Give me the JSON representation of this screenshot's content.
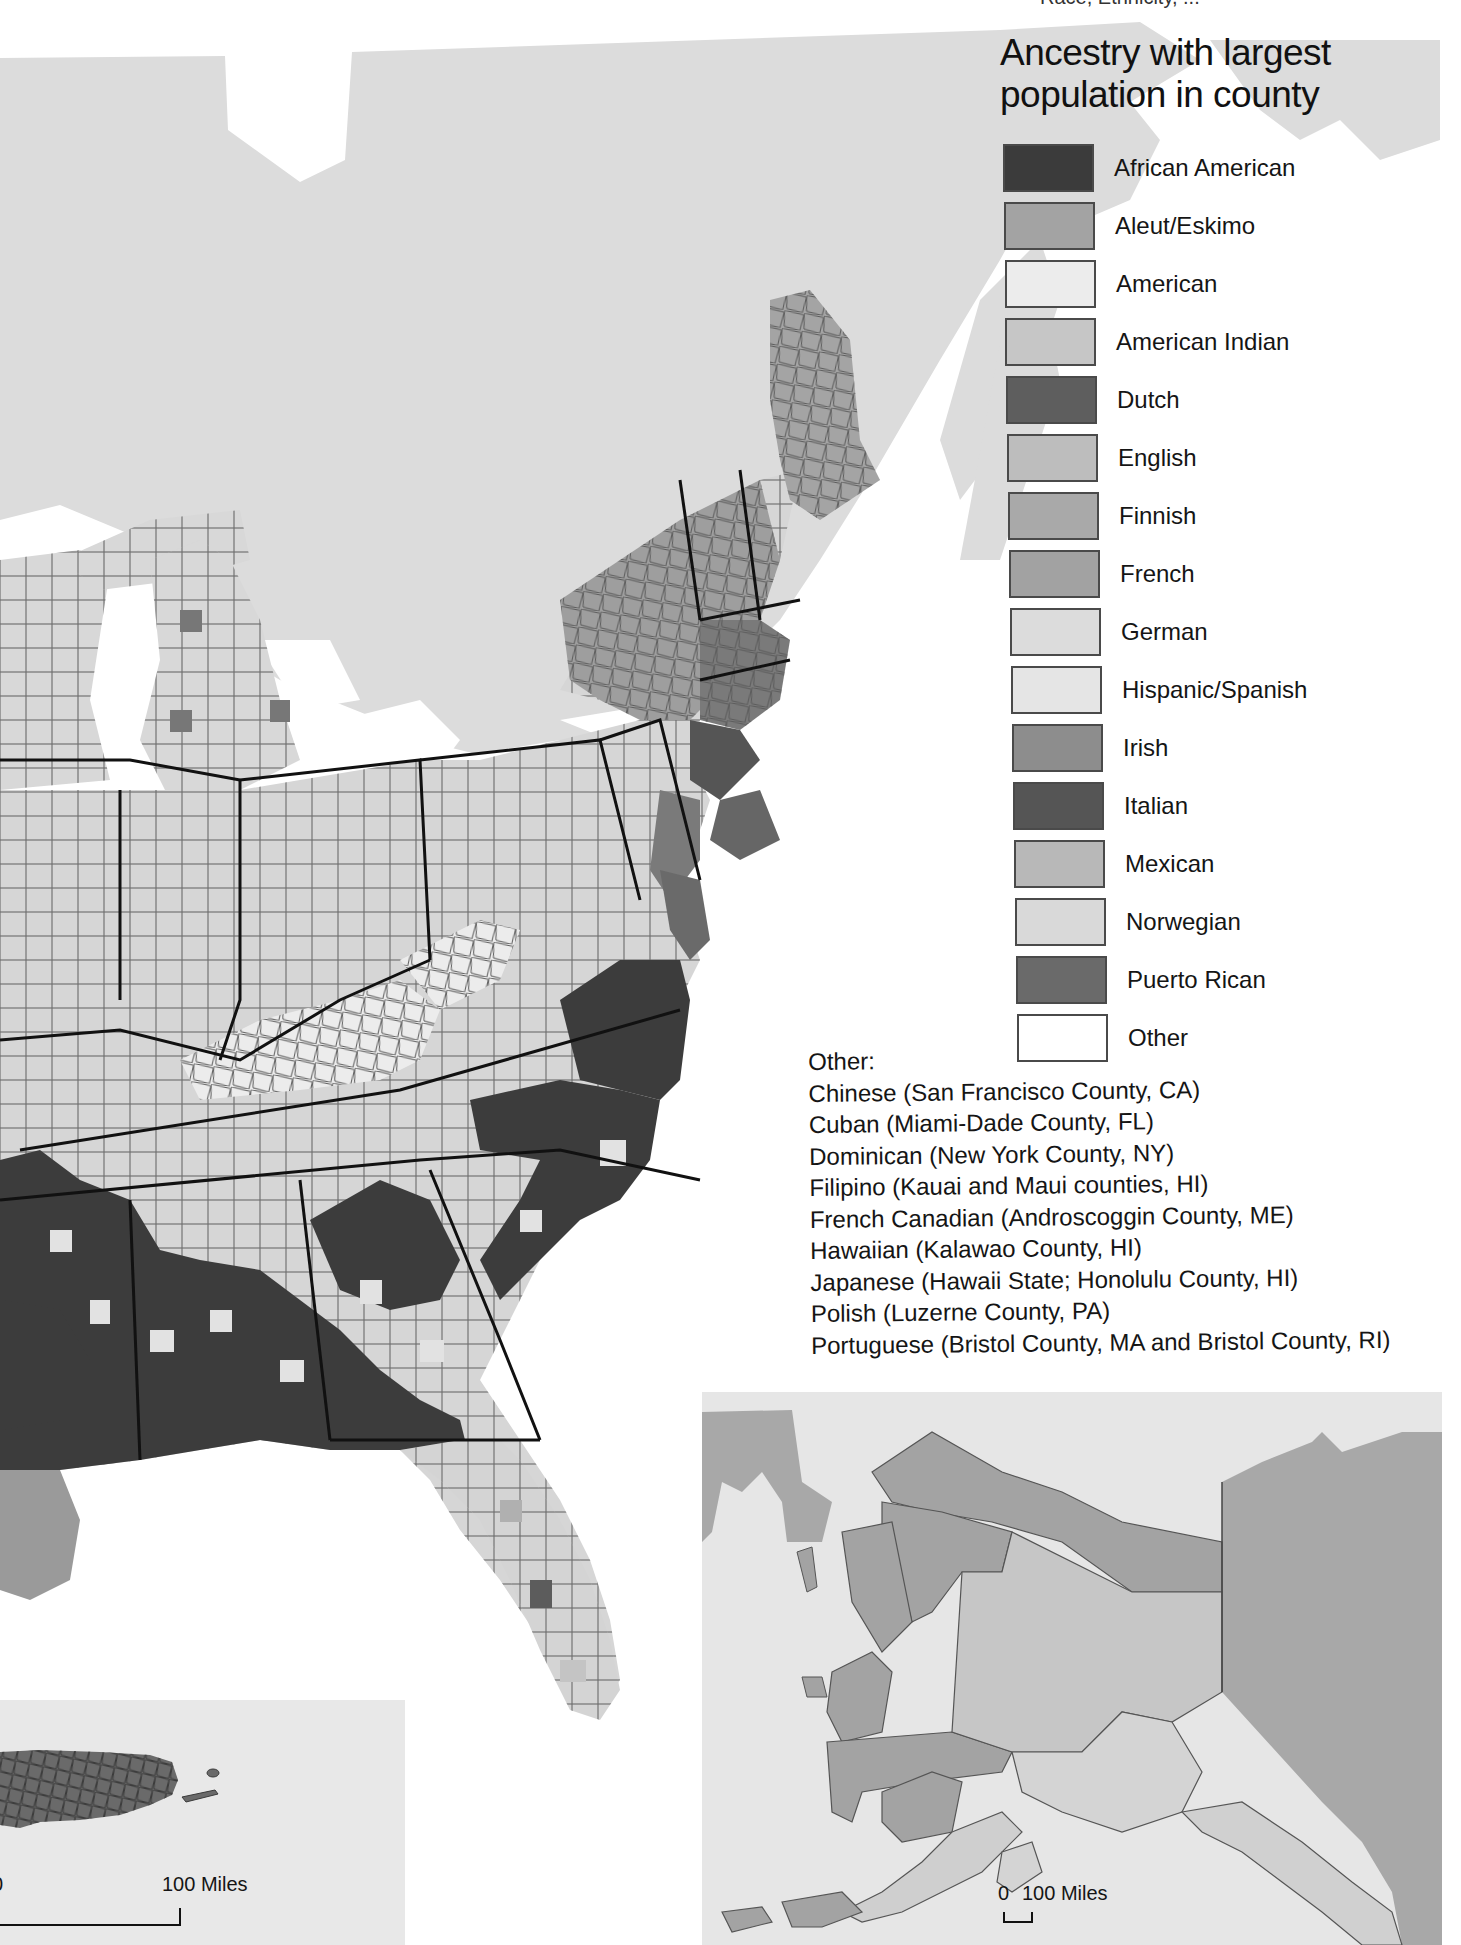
{
  "top_clipped_text": "Race, Ethnicity, ...",
  "legend": {
    "title_line1": "Ancestry with largest",
    "title_line2": "population in county",
    "items": [
      {
        "label": "African American",
        "color": "#3b3b3b"
      },
      {
        "label": "Aleut/Eskimo",
        "color": "#a3a3a3"
      },
      {
        "label": "American",
        "color": "#ececec"
      },
      {
        "label": "American Indian",
        "color": "#c6c6c6"
      },
      {
        "label": "Dutch",
        "color": "#5e5e5e"
      },
      {
        "label": "English",
        "color": "#bdbdbd"
      },
      {
        "label": "Finnish",
        "color": "#a9a9a9"
      },
      {
        "label": "French",
        "color": "#a2a2a2"
      },
      {
        "label": "German",
        "color": "#dcdcdc"
      },
      {
        "label": "Hispanic/Spanish",
        "color": "#e5e5e5"
      },
      {
        "label": "Irish",
        "color": "#8d8d8d"
      },
      {
        "label": "Italian",
        "color": "#555555"
      },
      {
        "label": "Mexican",
        "color": "#b8b8b8"
      },
      {
        "label": "Norwegian",
        "color": "#d9d9d9"
      },
      {
        "label": "Puerto Rican",
        "color": "#6a6a6a"
      },
      {
        "label": "Other",
        "color": "#ffffff"
      }
    ]
  },
  "other_notes": {
    "heading": "Other:",
    "lines": [
      "Chinese (San Francisco County, CA)",
      "Cuban (Miami-Dade County, FL)",
      "Dominican (New York County, NY)",
      "Filipino (Kauai and Maui counties, HI)",
      "French Canadian (Androscoggin County, ME)",
      "Hawaiian (Kalawao County, HI)",
      "Japanese (Hawaii State; Honolulu County, HI)",
      "Polish (Luzerne County, PA)",
      "Portuguese (Bristol County, MA and Bristol County, RI)"
    ]
  },
  "insets": {
    "alaska": {
      "scale_zero": "0",
      "scale_label": "100 Miles"
    },
    "puerto_rico": {
      "scale_zero": "0",
      "scale_label": "100 Miles"
    }
  },
  "colors": {
    "canada_land": "#dcdcdc",
    "water": "#ffffff",
    "state_border": "#111111",
    "county_border": "#5a5a5a",
    "inset_bg": "#e6e6e6",
    "inset_land_dark": "#a8a8a8"
  }
}
